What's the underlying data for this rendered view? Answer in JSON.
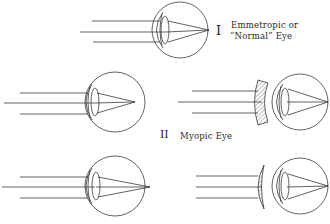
{
  "diagram": {
    "colors": {
      "ink": "#3a3a3a",
      "paper": "#ffffff",
      "hatch": "#5a5a5a"
    },
    "panels": [
      {
        "id": "I",
        "roman": "I",
        "caption_line1": "Emmetropic or",
        "caption_line2": "“Normal” Eye",
        "focus": "on retina",
        "corrective_lens": "none"
      },
      {
        "id": "II",
        "roman": "II",
        "caption": "Myopic Eye",
        "left": {
          "focus": "in front of retina",
          "corrective_lens": "none"
        },
        "right": {
          "focus": "on retina",
          "corrective_lens": "concave (diverging)"
        }
      },
      {
        "id": "III",
        "caption": "",
        "left": {
          "focus": "behind retina",
          "corrective_lens": "none"
        },
        "right": {
          "focus": "on retina",
          "corrective_lens": "convex (converging)"
        }
      }
    ]
  }
}
